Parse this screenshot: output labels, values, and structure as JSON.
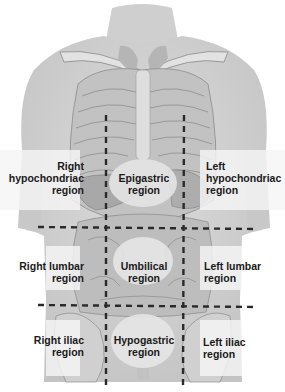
{
  "diagram": {
    "colors": {
      "background": "#ffffff",
      "skin": "#d4d4d4",
      "skin_dark": "#b8b8b8",
      "bone": "#dedede",
      "organ": "#a9a9a9",
      "panel": "#f2f2f2",
      "dash": "#2a2a2a",
      "text": "#1a1a1a"
    },
    "dividers": {
      "vertical_left_x": 106,
      "vertical_right_x": 184,
      "horizontal_upper_y": 228,
      "horizontal_lower_y": 306
    },
    "regions": [
      {
        "id": "right-hypochondriac",
        "line1": "Right",
        "line2": "hypochondriac",
        "line3": "region"
      },
      {
        "id": "epigastric",
        "line1": "Epigastric",
        "line2": "region"
      },
      {
        "id": "left-hypochondriac",
        "line1": "Left",
        "line2": "hypochondriac",
        "line3": "region"
      },
      {
        "id": "right-lumbar",
        "line1": "Right lumbar",
        "line2": "region"
      },
      {
        "id": "umbilical",
        "line1": "Umbilical",
        "line2": "region"
      },
      {
        "id": "left-lumbar",
        "line1": "Left lumbar",
        "line2": "region"
      },
      {
        "id": "right-iliac",
        "line1": "Right iliac",
        "line2": "region"
      },
      {
        "id": "hypogastric",
        "line1": "Hypogastric",
        "line2": "region"
      },
      {
        "id": "left-iliac",
        "line1": "Left iliac",
        "line2": "region"
      }
    ]
  }
}
